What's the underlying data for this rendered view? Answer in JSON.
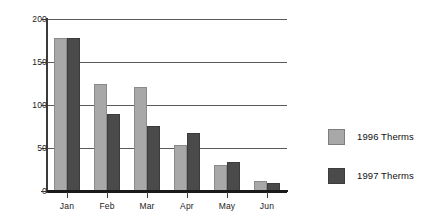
{
  "chart_data": {
    "type": "bar",
    "title": "",
    "subtitle": "",
    "xlabel": "",
    "ylabel": "",
    "categories": [
      "Jan",
      "Feb",
      "Mar",
      "Apr",
      "May",
      "Jun"
    ],
    "series": [
      {
        "name": "1996 Therms",
        "color": "#a8a8a8",
        "values": [
          178,
          125,
          121,
          54,
          30,
          12
        ]
      },
      {
        "name": "1997 Therms",
        "color": "#4a4a4a",
        "values": [
          178,
          90,
          76,
          68,
          34,
          9
        ]
      }
    ],
    "ylim": [
      0,
      200
    ],
    "yticks": [
      0,
      50,
      100,
      150,
      200
    ],
    "ytick_labels": [
      "0",
      "50",
      "100",
      "150",
      "200"
    ],
    "grid": true,
    "grid_axis": "y",
    "legend_position": "right",
    "legend_entries": [
      "1996 Therms",
      "1997 Therms"
    ]
  },
  "axes": {
    "y_tick_labels": [
      "200",
      "150",
      "100",
      "50",
      "0"
    ],
    "x_tick_labels": [
      "Jan",
      "Feb",
      "Mar",
      "Apr",
      "May",
      "Jun"
    ]
  },
  "legend": {
    "rows": [
      {
        "label": "1996 Therms",
        "color": "#a8a8a8"
      },
      {
        "label": "1997 Therms",
        "color": "#4a4a4a"
      }
    ]
  },
  "colors": {
    "series_1996": "#a8a8a8",
    "series_1997": "#4a4a4a",
    "gridline": "#5a5a5a",
    "axis": "#1a1a1a",
    "text": "#1c1c1c",
    "background": "#ffffff"
  }
}
